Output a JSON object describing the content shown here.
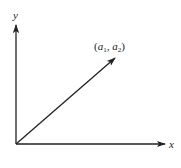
{
  "diagram": {
    "type": "vector-on-axes",
    "axes": {
      "x_label": "x",
      "y_label": "y"
    },
    "vector": {
      "label_open": "(",
      "label_a": "a",
      "label_sub1": "1",
      "label_sep": ", ",
      "label_a2": "a",
      "label_sub2": "2",
      "label_close": ")",
      "from": "origin",
      "to_label": "(a1, a2)"
    },
    "colors": {
      "stroke": "#222222",
      "background": "#ffffff"
    }
  }
}
